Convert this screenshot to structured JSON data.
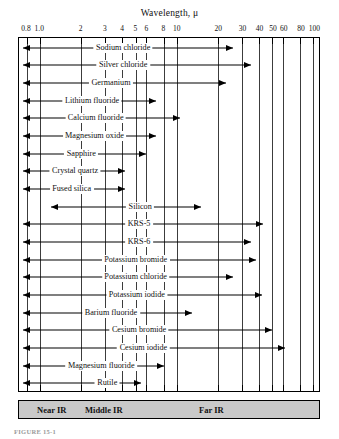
{
  "figure": {
    "title": "Wavelength, μ",
    "caption": "FIGURE 15-1"
  },
  "legend": {
    "items": [
      {
        "label": "Near IR",
        "x_pct": 6
      },
      {
        "label": "Middle IR",
        "x_pct": 22
      },
      {
        "label": "Far IR",
        "x_pct": 60
      }
    ]
  },
  "chart_data": {
    "type": "bar",
    "orientation": "horizontal",
    "title": "Wavelength, μ",
    "xlabel": "Wavelength, μ",
    "ylabel": "",
    "xscale": "log",
    "xlim": [
      0.7,
      110
    ],
    "grid": true,
    "legend_position": "bottom",
    "xticks": [
      0.8,
      1.0,
      2,
      3,
      4,
      5,
      6,
      8,
      10,
      20,
      30,
      40,
      50,
      60,
      80,
      100
    ],
    "xticklabels": [
      "0.8",
      "1.0",
      "2",
      "3",
      "4",
      "5",
      "6",
      "8",
      "10",
      "20",
      "30",
      "40",
      "50",
      "60",
      "80",
      "100"
    ],
    "categories": [
      "Sodium chloride",
      "Silver chloride",
      "Germanium",
      "Lithium fluoride",
      "Calcium fluoride",
      "Magnesium oxide",
      "Sapphire",
      "Crystal quartz",
      "Fused silica",
      "Silicon",
      "KRS-5",
      "KRS-6",
      "Potassium bromide",
      "Potassium chloride",
      "Potassium iodide",
      "Barium fluoride",
      "Cesium bromide",
      "Cesium iodide",
      "Magnesium fluoride",
      "Rutile"
    ],
    "ranges": [
      {
        "name": "Sodium chloride",
        "min": 0.75,
        "max": 26,
        "label": "Sodium chloride"
      },
      {
        "name": "Silver chloride",
        "min": 0.75,
        "max": 35,
        "label": "Silver chloride"
      },
      {
        "name": "Germanium",
        "min": 0.75,
        "max": 23,
        "label": "Germanium"
      },
      {
        "name": "Lithium fluoride",
        "min": 0.75,
        "max": 7.0,
        "label": "Lithium fluoride"
      },
      {
        "name": "Calcium fluoride",
        "min": 0.75,
        "max": 10.5,
        "label": "Calcium fluoride"
      },
      {
        "name": "Magnesium oxide",
        "min": 0.75,
        "max": 7.0,
        "label": "Magnesium oxide"
      },
      {
        "name": "Sapphire",
        "min": 0.75,
        "max": 6.0,
        "label": "Sapphire"
      },
      {
        "name": "Crystal quartz",
        "min": 0.75,
        "max": 4.2,
        "label": "Crystal quartz"
      },
      {
        "name": "Fused silica",
        "min": 0.75,
        "max": 4.2,
        "label": "Fused silica"
      },
      {
        "name": "Silicon",
        "min": 1.2,
        "max": 15,
        "label": "Silicon"
      },
      {
        "name": "KRS-5",
        "min": 0.75,
        "max": 43,
        "label": "KRS-5"
      },
      {
        "name": "KRS-6",
        "min": 0.75,
        "max": 35,
        "label": "KRS-6"
      },
      {
        "name": "Potassium bromide",
        "min": 0.75,
        "max": 38,
        "label": "Potassium bromide"
      },
      {
        "name": "Potassium chloride",
        "min": 0.75,
        "max": 26,
        "label": "Potassium chloride"
      },
      {
        "name": "Potassium iodide",
        "min": 0.75,
        "max": 42,
        "label": "Potassium iodide"
      },
      {
        "name": "Barium fluoride",
        "min": 0.75,
        "max": 13,
        "label": "Barium fluoride"
      },
      {
        "name": "Cesium bromide",
        "min": 0.75,
        "max": 50,
        "label": "Cesium bromide"
      },
      {
        "name": "Cesium iodide",
        "min": 0.75,
        "max": 62,
        "label": "Cesium iodide"
      },
      {
        "name": "Magnesium fluoride",
        "min": 0.75,
        "max": 8.0,
        "label": "Magnesium fluoride"
      },
      {
        "name": "Rutile",
        "min": 0.75,
        "max": 5.5,
        "label": "Rutile"
      }
    ],
    "label_positions": [
      4.05,
      4.05,
      3.3,
      2.4,
      2.55,
      2.5,
      2.0,
      1.8,
      1.7,
      5.4,
      5.3,
      5.3,
      5.0,
      5.0,
      5.1,
      3.3,
      5.3,
      5.7,
      2.8,
      3.1
    ]
  }
}
